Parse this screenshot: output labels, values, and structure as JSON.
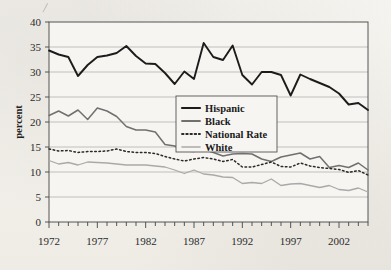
{
  "chart_data": {
    "type": "line",
    "title": "",
    "xlabel": "",
    "ylabel": "percent",
    "xlim": [
      1972,
      2005
    ],
    "ylim": [
      0,
      40
    ],
    "xticks": [
      1972,
      1977,
      1982,
      1987,
      1992,
      1997,
      2002
    ],
    "yticks": [
      0,
      5,
      10,
      15,
      20,
      25,
      30,
      35,
      40
    ],
    "grid": "horizontal",
    "legend_position": "center",
    "x": [
      1972,
      1973,
      1974,
      1975,
      1976,
      1977,
      1978,
      1979,
      1980,
      1981,
      1982,
      1983,
      1984,
      1985,
      1986,
      1987,
      1988,
      1989,
      1990,
      1991,
      1992,
      1993,
      1994,
      1995,
      1996,
      1997,
      1998,
      1999,
      2000,
      2001,
      2002,
      2003,
      2004,
      2005
    ],
    "series": [
      {
        "name": "Hispanic",
        "color": "#1c1c1c",
        "style": "solid",
        "width": 1.9,
        "values": [
          34.3,
          33.5,
          33.0,
          29.2,
          31.4,
          33.0,
          33.3,
          33.8,
          35.2,
          33.2,
          31.7,
          31.6,
          29.8,
          27.6,
          30.1,
          28.6,
          35.8,
          33.0,
          32.4,
          35.3,
          29.4,
          27.5,
          30.0,
          30.0,
          29.4,
          25.3,
          29.5,
          28.6,
          27.8,
          27.0,
          25.7,
          23.5,
          23.8,
          22.4
        ]
      },
      {
        "name": "Black",
        "color": "#707070",
        "style": "solid",
        "width": 1.5,
        "values": [
          21.3,
          22.2,
          21.2,
          22.4,
          20.5,
          22.8,
          22.2,
          21.1,
          19.1,
          18.4,
          18.4,
          18.0,
          15.5,
          15.2,
          14.2,
          14.1,
          14.5,
          13.9,
          13.2,
          13.6,
          13.7,
          13.6,
          12.6,
          12.1,
          13.0,
          13.4,
          13.8,
          12.6,
          13.1,
          10.9,
          11.3,
          10.9,
          11.8,
          10.4
        ]
      },
      {
        "name": "National Rate",
        "color": "#2a2a2a",
        "style": "dotted",
        "width": 1.5,
        "values": [
          14.6,
          14.2,
          14.3,
          13.9,
          14.1,
          14.1,
          14.2,
          14.6,
          14.1,
          13.9,
          13.9,
          13.7,
          13.1,
          12.6,
          12.2,
          12.6,
          12.9,
          12.6,
          12.1,
          12.5,
          11.0,
          11.0,
          11.5,
          12.0,
          11.1,
          11.0,
          11.8,
          11.2,
          10.9,
          10.7,
          10.5,
          9.9,
          10.3,
          9.4
        ]
      },
      {
        "name": "White",
        "color": "#a9a9a9",
        "style": "solid",
        "width": 1.3,
        "values": [
          12.3,
          11.6,
          11.9,
          11.4,
          12.0,
          11.9,
          11.8,
          11.6,
          11.4,
          11.4,
          11.4,
          11.2,
          11.0,
          10.4,
          9.7,
          10.4,
          9.6,
          9.4,
          9.0,
          8.9,
          7.7,
          7.9,
          7.7,
          8.6,
          7.3,
          7.6,
          7.7,
          7.3,
          6.9,
          7.3,
          6.5,
          6.3,
          6.8,
          6.0
        ]
      }
    ]
  },
  "axes": {
    "y_title": "percent",
    "y_tick_labels": [
      "40",
      "35",
      "30",
      "25",
      "20",
      "15",
      "10",
      "5",
      "0"
    ],
    "x_tick_labels": [
      "1972",
      "1977",
      "1982",
      "1987",
      "1992",
      "1997",
      "2002"
    ]
  },
  "legend": {
    "entries": [
      {
        "label": "Hispanic"
      },
      {
        "label": "Black"
      },
      {
        "label": "National Rate"
      },
      {
        "label": "White"
      }
    ]
  }
}
